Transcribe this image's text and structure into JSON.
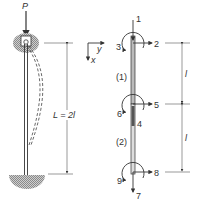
{
  "left_figure": {
    "load_label": "P",
    "length_label": "L = 2l",
    "deflected_shape": "dashed buckled column",
    "top_support": "pinned (hatched circular support)",
    "bottom_support": "fixed (hatched semicircular base)"
  },
  "axes": {
    "x_label": "x",
    "y_label": "y"
  },
  "right_figure": {
    "element_labels": [
      "(1)",
      "(2)"
    ],
    "node_dof_labels": {
      "top": {
        "axial": "1",
        "lateral": "2",
        "rotation": "3"
      },
      "middle": {
        "axial": "4",
        "lateral": "5",
        "rotation": "6"
      },
      "bottom": {
        "axial": "7",
        "lateral": "8",
        "rotation": "9"
      }
    },
    "segment_length_labels": [
      "l",
      "l"
    ]
  },
  "colors": {
    "line": "#333333",
    "hatch": "#999999",
    "background": "#ffffff"
  }
}
